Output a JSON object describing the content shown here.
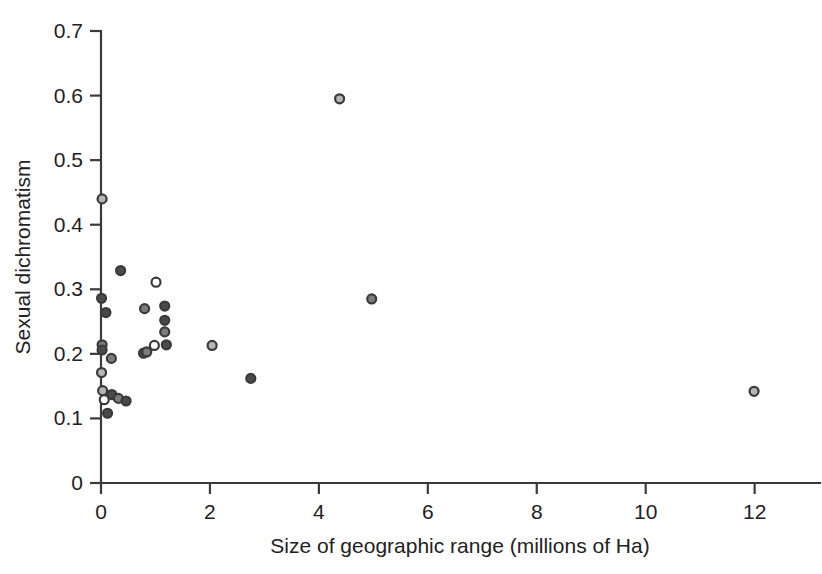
{
  "chart_data": {
    "type": "scatter",
    "title": "",
    "xlabel": "Size of geographic range (millions of Ha)",
    "ylabel": "Sexual dichromatism",
    "xlim": [
      0,
      13.2
    ],
    "ylim": [
      0,
      0.7
    ],
    "xticks": [
      0,
      2,
      4,
      6,
      8,
      10,
      12
    ],
    "xtick_labels": [
      "0",
      "2",
      "4",
      "6",
      "8",
      "10",
      "12"
    ],
    "yticks": [
      0,
      0.1,
      0.2,
      0.3,
      0.4,
      0.5,
      0.6,
      0.7
    ],
    "ytick_labels": [
      "0",
      "0.1",
      "0.2",
      "0.3",
      "0.4",
      "0.5",
      "0.6",
      "0.7"
    ],
    "grid": false,
    "legend": "none",
    "marker": "circle",
    "marker_size": 9,
    "colors": {
      "dark_fill": "#4a4a4a",
      "mid_fill": "#7c7c7c",
      "light_fill": "#b5b5b5",
      "open_fill": "#ffffff",
      "edge": "#3a3a3a",
      "axis": "#3a3a3a",
      "text": "#222222"
    },
    "points": [
      {
        "x": 0.02,
        "y": 0.44,
        "fill": "light_fill"
      },
      {
        "x": 0.01,
        "y": 0.286,
        "fill": "dark_fill"
      },
      {
        "x": 0.09,
        "y": 0.264,
        "fill": "dark_fill"
      },
      {
        "x": 0.02,
        "y": 0.214,
        "fill": "mid_fill"
      },
      {
        "x": 0.02,
        "y": 0.206,
        "fill": "dark_fill"
      },
      {
        "x": 0.01,
        "y": 0.171,
        "fill": "light_fill"
      },
      {
        "x": 0.03,
        "y": 0.143,
        "fill": "light_fill"
      },
      {
        "x": 0.06,
        "y": 0.129,
        "fill": "open_fill"
      },
      {
        "x": 0.12,
        "y": 0.108,
        "fill": "dark_fill"
      },
      {
        "x": 0.19,
        "y": 0.193,
        "fill": "mid_fill"
      },
      {
        "x": 0.2,
        "y": 0.137,
        "fill": "dark_fill"
      },
      {
        "x": 0.36,
        "y": 0.329,
        "fill": "dark_fill"
      },
      {
        "x": 0.32,
        "y": 0.131,
        "fill": "mid_fill"
      },
      {
        "x": 0.46,
        "y": 0.127,
        "fill": "dark_fill"
      },
      {
        "x": 0.78,
        "y": 0.201,
        "fill": "dark_fill"
      },
      {
        "x": 0.84,
        "y": 0.203,
        "fill": "mid_fill"
      },
      {
        "x": 0.8,
        "y": 0.27,
        "fill": "mid_fill"
      },
      {
        "x": 1.01,
        "y": 0.311,
        "fill": "open_fill"
      },
      {
        "x": 1.17,
        "y": 0.274,
        "fill": "dark_fill"
      },
      {
        "x": 1.17,
        "y": 0.252,
        "fill": "dark_fill"
      },
      {
        "x": 1.17,
        "y": 0.234,
        "fill": "mid_fill"
      },
      {
        "x": 1.2,
        "y": 0.214,
        "fill": "dark_fill"
      },
      {
        "x": 0.98,
        "y": 0.213,
        "fill": "open_fill"
      },
      {
        "x": 2.04,
        "y": 0.213,
        "fill": "light_fill"
      },
      {
        "x": 2.75,
        "y": 0.162,
        "fill": "dark_fill"
      },
      {
        "x": 4.38,
        "y": 0.595,
        "fill": "light_fill"
      },
      {
        "x": 4.97,
        "y": 0.285,
        "fill": "mid_fill"
      },
      {
        "x": 11.99,
        "y": 0.142,
        "fill": "light_fill"
      }
    ]
  },
  "figure": {
    "xlabel": "Size of geographic range (millions of Ha)",
    "ylabel": "Sexual dichromatism"
  }
}
